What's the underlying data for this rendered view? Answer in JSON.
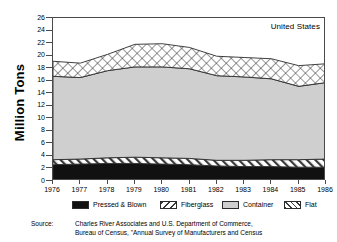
{
  "figure": {
    "ylabel": "Million Tons",
    "corner_note": "United States",
    "source_label": "Source:",
    "source_line1": "Charles River Associates and U.S. Department of Commerce,",
    "source_line2": "Bureau of Census, \"Annual Survey of Manufacturers and Census"
  },
  "colors": {
    "pressed_blown": "#111111",
    "fiberglass": "#ffffff",
    "container": "#cfcfcf",
    "flat": "#ffffff",
    "axis": "#4a4a4a",
    "line": "#2b2b2b",
    "background": "#ffffff"
  },
  "legend": {
    "items": [
      {
        "label": "Pressed & Blown",
        "pattern": "solid-black",
        "x": 20
      },
      {
        "label": "Fiberglass",
        "pattern": "diagonal-hatch",
        "x": 108
      },
      {
        "label": "Container",
        "pattern": "light-gray",
        "x": 170
      },
      {
        "label": "Flat",
        "pattern": "crosshatch",
        "x": 232
      }
    ]
  },
  "chart_data": {
    "type": "area",
    "title": "",
    "subtitle": "",
    "annotation": "United States",
    "xlabel": "",
    "ylabel": "Million Tons",
    "stacked": true,
    "grid": false,
    "legend_position": "bottom",
    "xlim": [
      1976,
      1986
    ],
    "ylim": [
      0,
      26
    ],
    "ytick_step": 2,
    "yticks": [
      0,
      2,
      4,
      6,
      8,
      10,
      12,
      14,
      16,
      18,
      20,
      22,
      24,
      26
    ],
    "x": [
      1976,
      1977,
      1978,
      1979,
      1980,
      1981,
      1982,
      1983,
      1984,
      1985,
      1986
    ],
    "categories": [
      "1976",
      "1977",
      "1978",
      "1979",
      "1980",
      "1981",
      "1982",
      "1983",
      "1984",
      "1985",
      "1986"
    ],
    "series": [
      {
        "name": "Pressed & Blown",
        "values": [
          2.6,
          2.7,
          2.8,
          2.8,
          2.7,
          2.6,
          2.4,
          2.3,
          2.3,
          2.2,
          2.2
        ]
      },
      {
        "name": "Fiberglass",
        "values": [
          0.8,
          0.8,
          0.9,
          1.0,
          1.0,
          1.0,
          0.9,
          1.0,
          1.1,
          1.2,
          1.3
        ]
      },
      {
        "name": "Container",
        "values": [
          13.3,
          13.0,
          13.9,
          14.4,
          14.5,
          14.3,
          13.5,
          13.3,
          12.9,
          11.7,
          12.2
        ]
      },
      {
        "name": "Flat",
        "values": [
          2.4,
          2.3,
          2.6,
          3.6,
          3.7,
          3.4,
          3.1,
          3.1,
          3.2,
          3.3,
          3.0
        ]
      }
    ],
    "cumulative_tops": {
      "pressed_blown": [
        2.6,
        2.7,
        2.8,
        2.8,
        2.7,
        2.6,
        2.4,
        2.3,
        2.3,
        2.2,
        2.2
      ],
      "fiberglass": [
        3.4,
        3.5,
        3.7,
        3.8,
        3.7,
        3.6,
        3.3,
        3.3,
        3.4,
        3.4,
        3.5
      ],
      "container": [
        16.7,
        16.5,
        17.6,
        18.2,
        18.2,
        17.9,
        16.8,
        16.6,
        16.3,
        15.1,
        15.7
      ],
      "flat": [
        19.1,
        18.8,
        20.2,
        21.8,
        21.9,
        21.3,
        19.9,
        19.7,
        19.5,
        18.4,
        18.7
      ]
    }
  }
}
